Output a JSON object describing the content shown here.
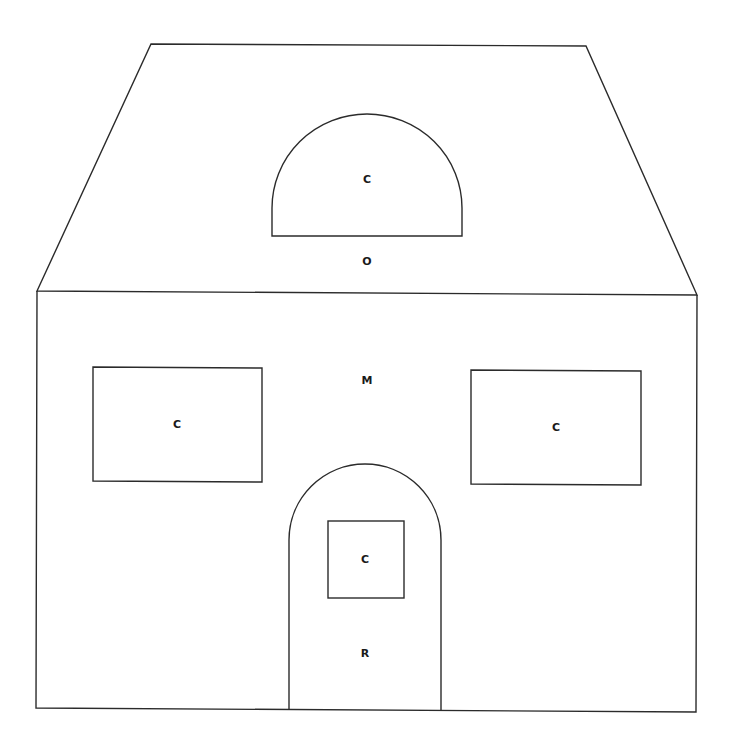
{
  "diagram": {
    "colors": {
      "stroke": "#2b2b2b",
      "label": "#1a1a1a",
      "background": "#ffffff"
    },
    "labels": {
      "dormer_window": "C",
      "roof": "O",
      "wall": "M",
      "left_window": "C",
      "right_window": "C",
      "door_window": "C",
      "door": "R"
    }
  }
}
